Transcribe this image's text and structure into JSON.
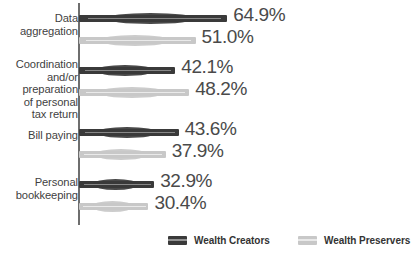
{
  "chart_data": {
    "type": "bar",
    "orientation": "horizontal",
    "title": "",
    "subtitle": "",
    "xlabel": "",
    "ylabel": "",
    "xlim": [
      0,
      70
    ],
    "grid": false,
    "legend_position": "bottom",
    "value_suffix": "%",
    "categories": [
      "Data aggregation",
      "Coordination and/or preparation of personal tax return",
      "Bill paying",
      "Personal bookkeeping"
    ],
    "category_lines": [
      [
        "Data",
        "aggregation"
      ],
      [
        "Coordination",
        "and/or",
        "preparation",
        "of personal",
        "tax return"
      ],
      [
        "Bill paying"
      ],
      [
        "Personal",
        "bookkeeping"
      ]
    ],
    "series": [
      {
        "name": "Wealth Creators",
        "color": "#3a3a3a",
        "values": [
          64.9,
          42.1,
          43.6,
          32.9
        ],
        "labels": [
          "64.9%",
          "42.1%",
          "43.6%",
          "32.9%"
        ]
      },
      {
        "name": "Wealth Preservers",
        "color": "#c8c8c8",
        "values": [
          51.0,
          48.2,
          37.9,
          30.4
        ],
        "labels": [
          "51.0%",
          "48.2%",
          "37.9%",
          "30.4%"
        ]
      }
    ]
  },
  "legend": {
    "items": [
      {
        "label": "Wealth Creators",
        "color": "#3a3a3a"
      },
      {
        "label": "Wealth Preservers",
        "color": "#c8c8c8"
      }
    ]
  },
  "colors": {
    "wealth_creators": "#3a3a3a",
    "wealth_preservers": "#c8c8c8",
    "axis": "#6e6e6e",
    "text": "#3f3f3f",
    "value_text": "#4a4a4a",
    "background": "#ffffff"
  }
}
